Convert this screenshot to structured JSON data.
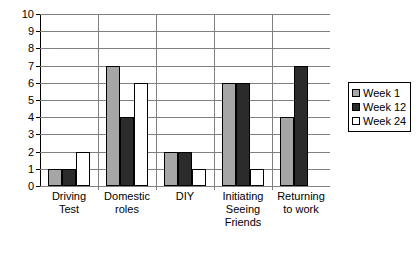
{
  "chart_data": {
    "type": "bar",
    "title": "",
    "subtitle": "",
    "xlabel": "",
    "ylabel": "",
    "ylim": [
      0,
      10
    ],
    "ytick_labels": [
      "10",
      "9",
      "8",
      "7",
      "6",
      "5",
      "4",
      "3",
      "2",
      "1",
      "0"
    ],
    "grid": true,
    "legend_position": "right",
    "categories": [
      "Driving Test",
      "Domestic roles",
      "DIY",
      "Initiating Seeing Friends",
      "Returning to work"
    ],
    "category_lines": [
      [
        "Driving",
        "Test"
      ],
      [
        "Domestic",
        "roles"
      ],
      [
        "DIY"
      ],
      [
        "Initiating",
        "Seeing",
        "Friends"
      ],
      [
        "Returning",
        "to work"
      ]
    ],
    "series": [
      {
        "name": "Week 1",
        "color": "#a6a6a6",
        "values": [
          1,
          7,
          2,
          6,
          4
        ]
      },
      {
        "name": "Week 12",
        "color": "#2b2b2b",
        "values": [
          1,
          4,
          2,
          6,
          7
        ]
      },
      {
        "name": "Week 24",
        "color": "#ffffff",
        "values": [
          2,
          6,
          1,
          1,
          0
        ]
      }
    ]
  },
  "legend": {
    "items": [
      {
        "label": "Week 1",
        "swatch": "w1"
      },
      {
        "label": "Week 12",
        "swatch": "w12"
      },
      {
        "label": "Week 24",
        "swatch": "w24"
      }
    ]
  }
}
